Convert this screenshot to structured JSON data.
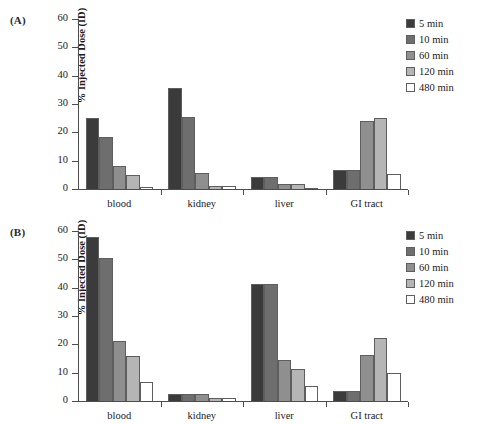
{
  "figure": {
    "panels": [
      {
        "id": "A",
        "label": "(A)"
      },
      {
        "id": "B",
        "label": "(B)"
      }
    ]
  },
  "legend": {
    "position": "top-right",
    "entries": [
      {
        "label": "5 min",
        "color": "#3b3b3b"
      },
      {
        "label": "10 min",
        "color": "#6e6e6e"
      },
      {
        "label": "60 min",
        "color": "#8f8f8f"
      },
      {
        "label": "120 min",
        "color": "#b5b5b5"
      },
      {
        "label": "480 min",
        "color": "#ffffff"
      }
    ]
  },
  "chart_data": [
    {
      "type": "bar",
      "panel": "(A)",
      "title": "",
      "xlabel": "",
      "ylabel": "% Injected Dose (ID)",
      "ylim": [
        0,
        60
      ],
      "yticks": [
        0,
        10,
        20,
        30,
        40,
        50,
        60
      ],
      "grid": false,
      "legend_position": "top-right",
      "categories": [
        "blood",
        "kidney",
        "liver",
        "GI tract"
      ],
      "series": [
        {
          "name": "5 min",
          "color": "#3b3b3b",
          "values": [
            25.2,
            35.6,
            4.2,
            6.8
          ]
        },
        {
          "name": "10 min",
          "color": "#6e6e6e",
          "values": [
            18.2,
            25.3,
            4.2,
            6.8
          ]
        },
        {
          "name": "60 min",
          "color": "#8f8f8f",
          "values": [
            8.0,
            5.7,
            1.9,
            24.0
          ]
        },
        {
          "name": "120 min",
          "color": "#b5b5b5",
          "values": [
            4.9,
            0.9,
            1.9,
            24.9
          ]
        },
        {
          "name": "480 min",
          "color": "#ffffff",
          "values": [
            0.8,
            1.0,
            0.3,
            5.3
          ]
        }
      ]
    },
    {
      "type": "bar",
      "panel": "(B)",
      "title": "",
      "xlabel": "",
      "ylabel": "% Injected Dose (ID)",
      "ylim": [
        0,
        60
      ],
      "yticks": [
        0,
        10,
        20,
        30,
        40,
        50,
        60
      ],
      "grid": false,
      "legend_position": "top-right",
      "categories": [
        "blood",
        "kidney",
        "liver",
        "GI tract"
      ],
      "series": [
        {
          "name": "5 min",
          "color": "#3b3b3b",
          "values": [
            58.0,
            2.5,
            41.2,
            3.5
          ]
        },
        {
          "name": "10 min",
          "color": "#6e6e6e",
          "values": [
            50.4,
            2.3,
            41.2,
            3.5
          ]
        },
        {
          "name": "60 min",
          "color": "#8f8f8f",
          "values": [
            21.3,
            2.5,
            14.4,
            16.2
          ]
        },
        {
          "name": "120 min",
          "color": "#b5b5b5",
          "values": [
            15.9,
            1.0,
            11.4,
            22.4
          ]
        },
        {
          "name": "480 min",
          "color": "#ffffff",
          "values": [
            6.6,
            1.1,
            5.2,
            10.0
          ]
        }
      ]
    }
  ]
}
